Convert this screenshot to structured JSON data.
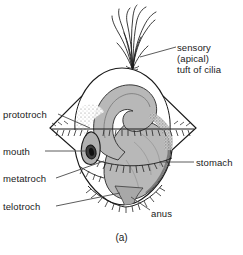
{
  "figure": {
    "caption": "(a)",
    "background_color": "#ffffff",
    "ink_color": "#1a1a1a",
    "body_fill_color": "#b8b8b8",
    "dome_fill_color": "#ffffff",
    "stipple_color": "#8a8a8a"
  },
  "labels": {
    "sensory": {
      "line1": "sensory",
      "line2": "(apical)",
      "line3": "tuft of cilia"
    },
    "prototroch": "prototroch",
    "mouth": "mouth",
    "metatroch": "metatroch",
    "telotroch": "telotroch",
    "stomach": "stomach",
    "anus": "anus"
  },
  "structures": [
    "apical tuft of cilia",
    "prototroch ciliary band",
    "mouth",
    "metatroch ciliary band",
    "telotroch ciliary band",
    "stomach",
    "anus"
  ]
}
